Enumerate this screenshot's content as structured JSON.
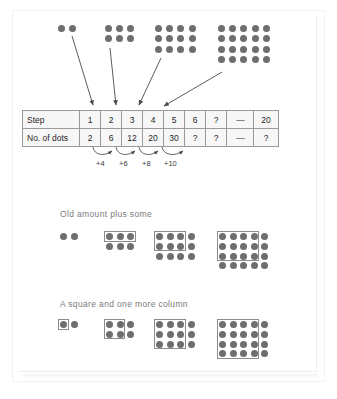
{
  "page": {
    "dot_color": "#6e6e6e",
    "box_color": "#8c8c8c",
    "heading_color": "#7b7b7b"
  },
  "top_figures": {
    "caption": "Dot arrays for steps 1 to 4",
    "figures": [
      {
        "step": 1,
        "cols": 2,
        "rows": 1,
        "dots": 2
      },
      {
        "step": 2,
        "cols": 3,
        "rows": 2,
        "dots": 6
      },
      {
        "step": 3,
        "cols": 4,
        "rows": 3,
        "dots": 12
      },
      {
        "step": 4,
        "cols": 5,
        "rows": 4,
        "dots": 20
      }
    ]
  },
  "arrows": {
    "count": 4,
    "description": "arrows from each dot array down to its step column in the table"
  },
  "table": {
    "rows": [
      {
        "label": "Step",
        "values": [
          "1",
          "2",
          "3",
          "4",
          "5",
          "6",
          "?",
          "—",
          "20"
        ]
      },
      {
        "label": "No. of dots",
        "values": [
          "2",
          "6",
          "12",
          "20",
          "30",
          "?",
          "?",
          "—",
          "?"
        ]
      }
    ]
  },
  "increments": {
    "labels": [
      "+4",
      "+6",
      "+8",
      "+10"
    ]
  },
  "sections": [
    {
      "heading": "Old amount plus some",
      "figures": [
        {
          "cols": 2,
          "rows": 1,
          "box": null
        },
        {
          "cols": 3,
          "rows": 2,
          "box": {
            "cols": 3,
            "rows": 1
          }
        },
        {
          "cols": 4,
          "rows": 3,
          "box": {
            "cols": 3,
            "rows": 2
          }
        },
        {
          "cols": 5,
          "rows": 4,
          "box": {
            "cols": 4,
            "rows": 3
          }
        }
      ]
    },
    {
      "heading": "A square and one more column",
      "figures": [
        {
          "cols": 2,
          "rows": 1,
          "box": {
            "cols": 1,
            "rows": 1
          }
        },
        {
          "cols": 3,
          "rows": 2,
          "box": {
            "cols": 2,
            "rows": 2
          }
        },
        {
          "cols": 4,
          "rows": 3,
          "box": {
            "cols": 3,
            "rows": 3
          }
        },
        {
          "cols": 5,
          "rows": 4,
          "box": {
            "cols": 4,
            "rows": 4
          }
        }
      ]
    }
  ]
}
